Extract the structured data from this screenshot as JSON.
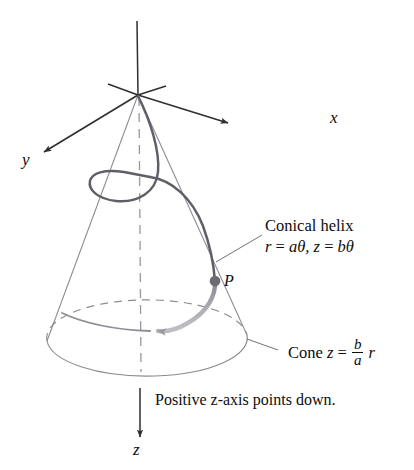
{
  "figure": {
    "axes": {
      "x_label": "x",
      "y_label": "y",
      "z_label": "z"
    },
    "point": {
      "label": "P"
    },
    "annotations": {
      "helix_title": "Conical helix",
      "helix_eq_r_lhs": "r",
      "helix_eq_eq1": "=",
      "helix_eq_r_rhs": "aθ,",
      "helix_eq_z_lhs": "z",
      "helix_eq_eq2": "=",
      "helix_eq_z_rhs": "bθ",
      "cone_word": "Cone",
      "cone_z": "z",
      "cone_eq": "=",
      "cone_num": "b",
      "cone_den": "a",
      "cone_r": "r",
      "caption": "Positive z-axis points down.",
      "caption_pre": "Positive ",
      "caption_it": "z",
      "caption_post": "-axis points down."
    },
    "colors": {
      "axis": "#2e2e33",
      "cone_outline": "#8a8a92",
      "helix": "#5f5f68",
      "helix_fade": "#b9b9c0",
      "dashed": "#8a8a92",
      "point": "#6b6b73",
      "text": "#0d0d0d",
      "background": "#ffffff"
    }
  }
}
